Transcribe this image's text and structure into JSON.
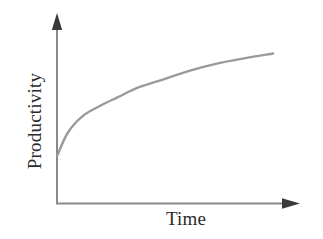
{
  "figure": {
    "background_color": "#ffffff",
    "axis_color": "#8a8a8a",
    "curve_color": "#9a9a9a",
    "label_color": "#2b2b2b"
  },
  "axes": {
    "y_axis_name": "y-axis-line",
    "x_axis_name": "x-axis-line",
    "y_arrow_name": "y-axis-arrowhead",
    "x_arrow_name": "x-axis-arrowhead"
  },
  "chart_data": {
    "type": "line",
    "title": "",
    "subtitle": "",
    "xlabel": "Time",
    "ylabel": "Productivity",
    "grid": false,
    "legend": false,
    "legend_position": "none",
    "axis_ticks": false,
    "tick_labels_x": [],
    "tick_labels_y": [],
    "xlim": [
      0,
      1
    ],
    "ylim": [
      0,
      1
    ],
    "annotations": [],
    "series": [
      {
        "name": "Productivity over time",
        "color": "#9a9a9a",
        "line_width": 2.4,
        "x": [
          0.0,
          0.05,
          0.12,
          0.2,
          0.28,
          0.38,
          0.5,
          0.62,
          0.74,
          0.86,
          1.0
        ],
        "y": [
          0.28,
          0.42,
          0.52,
          0.58,
          0.63,
          0.69,
          0.74,
          0.79,
          0.83,
          0.86,
          0.89
        ]
      }
    ]
  }
}
